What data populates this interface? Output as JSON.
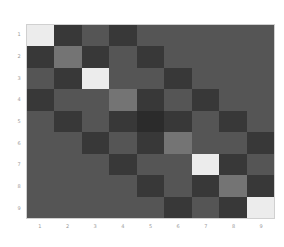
{
  "chart_data": {
    "type": "heatmap",
    "title": "",
    "xlabel": "",
    "ylabel": "",
    "x_ticks": [
      "1",
      "2",
      "3",
      "4",
      "5",
      "6",
      "7",
      "8",
      "9"
    ],
    "y_ticks": [
      "1",
      "2",
      "3",
      "4",
      "5",
      "6",
      "7",
      "8",
      "9"
    ],
    "colormap": "gray",
    "value_range": [
      0,
      1
    ],
    "matrix": [
      [
        1.0,
        0.15,
        0.3,
        0.15,
        0.3,
        0.3,
        0.3,
        0.3,
        0.3
      ],
      [
        0.15,
        0.45,
        0.15,
        0.3,
        0.15,
        0.3,
        0.3,
        0.3,
        0.3
      ],
      [
        0.3,
        0.15,
        1.0,
        0.3,
        0.3,
        0.15,
        0.3,
        0.3,
        0.3
      ],
      [
        0.15,
        0.3,
        0.3,
        0.45,
        0.15,
        0.3,
        0.15,
        0.3,
        0.3
      ],
      [
        0.3,
        0.15,
        0.3,
        0.15,
        0.08,
        0.15,
        0.3,
        0.15,
        0.3
      ],
      [
        0.3,
        0.3,
        0.15,
        0.3,
        0.15,
        0.45,
        0.3,
        0.3,
        0.15
      ],
      [
        0.3,
        0.3,
        0.3,
        0.15,
        0.3,
        0.3,
        1.0,
        0.15,
        0.3
      ],
      [
        0.3,
        0.3,
        0.3,
        0.3,
        0.15,
        0.3,
        0.15,
        0.45,
        0.15
      ],
      [
        0.3,
        0.3,
        0.3,
        0.3,
        0.3,
        0.15,
        0.3,
        0.15,
        1.0
      ]
    ],
    "grid": false,
    "legend": null
  }
}
